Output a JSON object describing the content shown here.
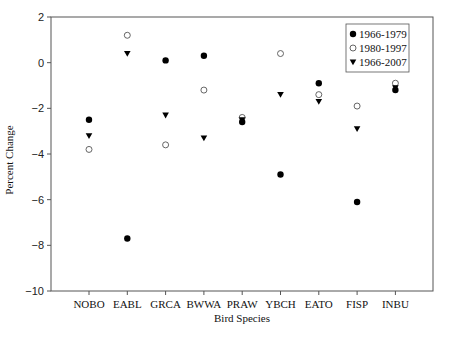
{
  "chart_data": {
    "type": "scatter",
    "title": "",
    "xlabel": "Bird Species",
    "ylabel": "Percent Change",
    "ylim": [
      -10,
      2
    ],
    "yticks": [
      2,
      0,
      -2,
      -4,
      -6,
      -8,
      -10
    ],
    "ytick_labels": [
      "2",
      "0",
      "−2",
      "−4",
      "−6",
      "−8",
      "−10"
    ],
    "grid": false,
    "legend_position": "upper right",
    "categories": [
      "NOBO",
      "EABL",
      "GRCA",
      "BWWA",
      "PRAW",
      "YBCH",
      "EATO",
      "FISP",
      "INBU"
    ],
    "series": [
      {
        "name": "1966-1979",
        "marker": "filled-circle",
        "color": "#000000",
        "values": [
          -2.5,
          -7.7,
          0.1,
          0.3,
          -2.6,
          -4.9,
          -0.9,
          -6.1,
          -1.2
        ]
      },
      {
        "name": "1980-1997",
        "marker": "open-circle",
        "color": "#000000",
        "values": [
          -3.8,
          1.2,
          -3.6,
          -1.2,
          -2.4,
          0.4,
          -1.4,
          -1.9,
          -0.9
        ]
      },
      {
        "name": "1966-2007",
        "marker": "filled-triangle-down",
        "color": "#000000",
        "values": [
          -3.2,
          0.4,
          -2.3,
          -3.3,
          -2.5,
          -1.4,
          -1.7,
          -2.9,
          -1.1
        ]
      }
    ]
  }
}
